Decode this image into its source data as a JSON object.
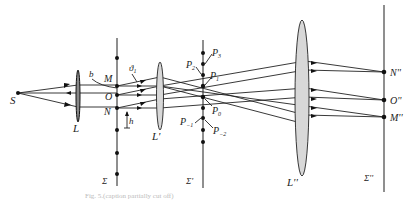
{
  "figure": {
    "caption": "Fig. 5.(caption partially cut off)",
    "planes": {
      "sigma": "Σ",
      "sigma_prime": "Σ'",
      "sigma_double_prime": "Σ''"
    },
    "lenses": {
      "L": "L",
      "L_prime": "L'",
      "L_double_prime": "L''"
    },
    "source": "S",
    "object_points": {
      "M": "M",
      "O": "O",
      "N": "N"
    },
    "image_points": {
      "N2": "N''",
      "O2": "O''",
      "M2": "M''"
    },
    "spectrum_points": {
      "P3": "P",
      "P3_sub": "3",
      "P2": "P",
      "P2_sub": "2",
      "P1": "P",
      "P1_sub": "1",
      "P0": "P",
      "P0_sub": "0",
      "Pm1": "P",
      "Pm1_sub": "−1",
      "Pm2": "P",
      "Pm2_sub": "−2"
    },
    "annotations": {
      "b": "b",
      "theta1": "ϑ",
      "theta1_sub": "1",
      "h": "h"
    }
  }
}
